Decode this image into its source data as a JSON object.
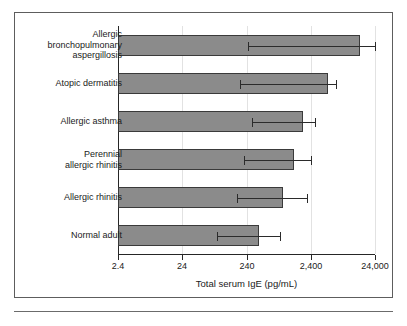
{
  "figure": {
    "has_border": true,
    "has_bottom_rule": true,
    "background_color": "#ffffff",
    "bar_fill_color": "#8b8b8b",
    "bar_border_color": "#3a3a3a",
    "axis_color": "#262626",
    "gridline_color": "#e2e2e2"
  },
  "chart_data": {
    "type": "bar",
    "orientation": "horizontal",
    "title": "",
    "xlabel": "Total serum IgE (pg/mL)",
    "ylabel": "",
    "xscale": "log",
    "xlim": [
      2.4,
      24000
    ],
    "xticks": [
      2.4,
      24,
      240,
      2400,
      24000
    ],
    "xticklabels": [
      "2.4",
      "24",
      "240",
      "2,400",
      "24,000"
    ],
    "grid": true,
    "grid_axis": "x",
    "legend": null,
    "categories": [
      "Allergic bronchopulmonary aspergillosis",
      "Atopic dermatitis",
      "Allergic asthma",
      "Perennial allergic rhinitis",
      "Allergic rhinitis",
      "Normal adult"
    ],
    "category_labels_multiline": [
      [
        "Allergic",
        "bronchopulmonary",
        "aspergillosis"
      ],
      [
        "Atopic dermatitis"
      ],
      [
        "Allergic asthma"
      ],
      [
        "Perennial",
        "allergic rhinitis"
      ],
      [
        "Allergic rhinitis"
      ],
      [
        "Normal adult"
      ]
    ],
    "values": [
      14000,
      4500,
      1800,
      1300,
      900,
      380
    ],
    "err_low": [
      250,
      190,
      290,
      220,
      170,
      82
    ],
    "err_high": [
      24000,
      6000,
      2800,
      2400,
      2100,
      800
    ],
    "series": [
      {
        "name": "Total serum IgE (pg/mL)",
        "values": [
          14000,
          4500,
          1800,
          1300,
          900,
          380
        ]
      }
    ]
  },
  "bars": [
    {
      "label_lines": [
        "Allergic",
        "bronchopulmonary",
        "aspergillosis"
      ],
      "value": 14000,
      "err_low": 250,
      "err_high": 24000
    },
    {
      "label_lines": [
        "Atopic dermatitis"
      ],
      "value": 4500,
      "err_low": 190,
      "err_high": 6000
    },
    {
      "label_lines": [
        "Allergic asthma"
      ],
      "value": 1800,
      "err_low": 290,
      "err_high": 2800
    },
    {
      "label_lines": [
        "Perennial",
        "allergic rhinitis"
      ],
      "value": 1300,
      "err_low": 220,
      "err_high": 2400
    },
    {
      "label_lines": [
        "Allergic rhinitis"
      ],
      "value": 900,
      "err_low": 170,
      "err_high": 2100
    },
    {
      "label_lines": [
        "Normal adult"
      ],
      "value": 380,
      "err_low": 82,
      "err_high": 800
    }
  ],
  "axis": {
    "x_title": "Total serum IgE (pg/mL)",
    "tick_labels": [
      "2.4",
      "24",
      "240",
      "2,400",
      "24,000"
    ]
  }
}
